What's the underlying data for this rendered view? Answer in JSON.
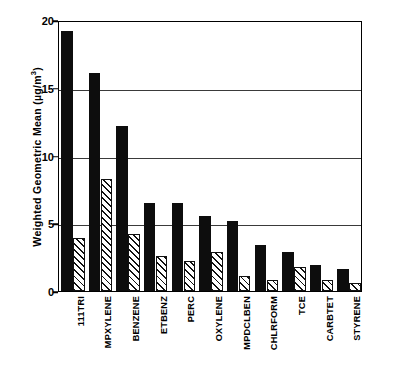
{
  "chart_data": {
    "type": "bar",
    "title": "",
    "xlabel": "",
    "ylabel": "Weighted Geometric Mean (µg/m",
    "ylabel_exponent": "3",
    "ylabel_suffix": ")",
    "ylim": [
      0,
      20
    ],
    "yticks": [
      0,
      5,
      10,
      15,
      20
    ],
    "ytick_labels": [
      "0",
      "5",
      "10",
      "15",
      "20"
    ],
    "grid": true,
    "grid_axis": "y",
    "legend": "none",
    "categories": [
      "111TRI",
      "MPXYLENE",
      "BENZENE",
      "ETBENZ",
      "PERC",
      "OXYLENE",
      "MPDCLBEN",
      "CHLRFORM",
      "TCE",
      "CARBTET",
      "STYRENE"
    ],
    "series": [
      {
        "name": "solid",
        "style": "solid-black",
        "values": [
          19.2,
          16.1,
          12.2,
          6.5,
          6.5,
          5.5,
          5.2,
          3.4,
          2.9,
          1.9,
          1.6
        ]
      },
      {
        "name": "hatched",
        "style": "diagonal-hatch",
        "values": [
          3.9,
          8.3,
          4.2,
          2.6,
          2.2,
          2.9,
          1.1,
          0.8,
          1.8,
          0.8,
          0.6
        ]
      }
    ]
  },
  "colors": {
    "solid_bar": "#0d0d0d",
    "hatch_bar": "#ffffff",
    "hatch_line": "#111111",
    "grid": "#3a3a3a",
    "frame": "#000000",
    "background": "#ffffff"
  }
}
